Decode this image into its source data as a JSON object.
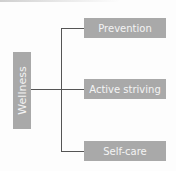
{
  "diagram": {
    "root": {
      "label": "Wellness"
    },
    "children": [
      {
        "label": "Prevention"
      },
      {
        "label": "Active striving"
      },
      {
        "label": "Self-care"
      }
    ],
    "colors": {
      "box": "#a9a9a9",
      "text": "#f4f4f4",
      "line": "#555555"
    }
  }
}
